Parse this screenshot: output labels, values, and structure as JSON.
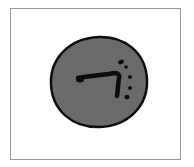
{
  "image": {
    "description": "Hand-drawn gray circle icon with black outline containing a bent bar stroke and a column of dots",
    "icon_name": "gray-disc-glyph-icon",
    "colors": {
      "background": "#ffffff",
      "frame_border": "#9a9a9a",
      "disc_fill": "#6b6b6b",
      "ink": "#0d0d0d"
    }
  }
}
